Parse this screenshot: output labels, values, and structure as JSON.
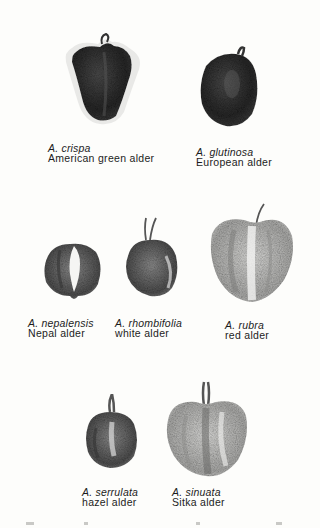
{
  "figure": {
    "specimens": [
      {
        "scientific": "A. crispa",
        "common": "American green alder",
        "tone": "dark"
      },
      {
        "scientific": "A. glutinosa",
        "common": "European alder",
        "tone": "dark"
      },
      {
        "scientific": "A. nepalensis",
        "common": "Nepal alder",
        "tone": "medium"
      },
      {
        "scientific": "A. rhombifolia",
        "common": "white alder",
        "tone": "medium"
      },
      {
        "scientific": "A. rubra",
        "common": "red alder",
        "tone": "light"
      },
      {
        "scientific": "A. serrulata",
        "common": "hazel alder",
        "tone": "medium"
      },
      {
        "scientific": "A. sinuata",
        "common": "Sitka alder",
        "tone": "light"
      }
    ]
  }
}
